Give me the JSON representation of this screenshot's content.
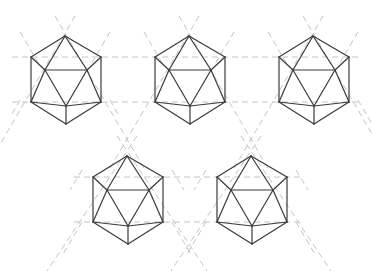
{
  "diagram": {
    "title": "",
    "colors": {
      "background": "#ffffff",
      "edge": "#3a3a3a",
      "guide": "#c4c4c4"
    },
    "shape_template": {
      "vertices": {
        "top": [
          0,
          -29
        ],
        "upper_left": [
          -34,
          -8
        ],
        "upper_right": [
          36,
          -8
        ],
        "inner_left": [
          -20,
          5
        ],
        "inner_right": [
          22,
          5
        ],
        "lower_left": [
          -34,
          37
        ],
        "lower_right": [
          36,
          37
        ],
        "inner_bottom": [
          1,
          41
        ],
        "bottom": [
          1,
          59
        ]
      },
      "edges": [
        [
          "top",
          "upper_left"
        ],
        [
          "top",
          "upper_right"
        ],
        [
          "top",
          "inner_left"
        ],
        [
          "top",
          "inner_right"
        ],
        [
          "upper_left",
          "lower_left"
        ],
        [
          "upper_right",
          "lower_right"
        ],
        [
          "upper_left",
          "inner_left"
        ],
        [
          "upper_right",
          "inner_right"
        ],
        [
          "inner_left",
          "inner_right"
        ],
        [
          "inner_left",
          "lower_left"
        ],
        [
          "inner_right",
          "lower_right"
        ],
        [
          "inner_left",
          "inner_bottom"
        ],
        [
          "inner_right",
          "inner_bottom"
        ],
        [
          "lower_left",
          "inner_bottom"
        ],
        [
          "lower_right",
          "inner_bottom"
        ],
        [
          "lower_left",
          "bottom"
        ],
        [
          "lower_right",
          "bottom"
        ],
        [
          "inner_bottom",
          "bottom"
        ]
      ]
    },
    "shapes": [
      {
        "name": "icosahedron-1",
        "center": [
          65,
          65
        ]
      },
      {
        "name": "icosahedron-2",
        "center": [
          189,
          65
        ]
      },
      {
        "name": "icosahedron-3",
        "center": [
          313,
          65
        ]
      },
      {
        "name": "icosahedron-4",
        "center": [
          127,
          185
        ]
      },
      {
        "name": "icosahedron-5",
        "center": [
          251,
          185
        ]
      }
    ],
    "guides": {
      "horizontal": [
        {
          "y": 57,
          "x1": 12,
          "x2": 362
        },
        {
          "y": 102,
          "x1": 12,
          "x2": 362
        },
        {
          "y": 177,
          "x1": 74,
          "x2": 300
        },
        {
          "y": 222,
          "x1": 74,
          "x2": 300
        }
      ],
      "diagonal": [
        [
          [
            55,
            16
          ],
          [
            145,
            170
          ]
        ],
        [
          [
            75,
            16
          ],
          [
            -15,
            170
          ]
        ],
        [
          [
            179,
            16
          ],
          [
            269,
            170
          ]
        ],
        [
          [
            199,
            16
          ],
          [
            109,
            170
          ]
        ],
        [
          [
            303,
            16
          ],
          [
            372,
            134
          ]
        ],
        [
          [
            323,
            16
          ],
          [
            233,
            170
          ]
        ],
        [
          [
            20,
            32
          ],
          [
            40,
            66
          ]
        ],
        [
          [
            110,
            32
          ],
          [
            90,
            66
          ]
        ],
        [
          [
            144,
            32
          ],
          [
            164,
            66
          ]
        ],
        [
          [
            234,
            32
          ],
          [
            214,
            66
          ]
        ],
        [
          [
            268,
            32
          ],
          [
            288,
            66
          ]
        ],
        [
          [
            358,
            32
          ],
          [
            338,
            66
          ]
        ],
        [
          [
            117,
            136
          ],
          [
            207,
            271
          ]
        ],
        [
          [
            137,
            136
          ],
          [
            47,
            271
          ]
        ],
        [
          [
            241,
            136
          ],
          [
            331,
            271
          ]
        ],
        [
          [
            261,
            136
          ],
          [
            171,
            271
          ]
        ],
        [
          [
            20,
            100
          ],
          [
            12,
            114
          ]
        ],
        [
          [
            110,
            100
          ],
          [
            118,
            114
          ]
        ],
        [
          [
            82,
            170
          ],
          [
            70,
            190
          ]
        ],
        [
          [
            172,
            170
          ],
          [
            184,
            190
          ]
        ],
        [
          [
            206,
            170
          ],
          [
            194,
            190
          ]
        ],
        [
          [
            296,
            170
          ],
          [
            308,
            190
          ]
        ],
        [
          [
            82,
            222
          ],
          [
            62,
            256
          ]
        ],
        [
          [
            172,
            222
          ],
          [
            192,
            256
          ]
        ],
        [
          [
            206,
            222
          ],
          [
            186,
            256
          ]
        ],
        [
          [
            296,
            222
          ],
          [
            316,
            256
          ]
        ],
        [
          [
            358,
            100
          ],
          [
            372,
            124
          ]
        ]
      ]
    }
  }
}
